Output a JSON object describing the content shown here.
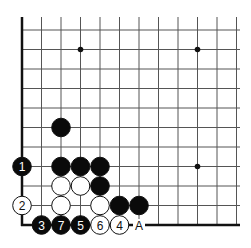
{
  "diagram": {
    "type": "go-board-corner",
    "corner": "bottom-left",
    "grid": {
      "origin_x": 22,
      "origin_y": 225,
      "spacing": 19.5,
      "cols": 12,
      "rows": 11
    },
    "star_points": [
      {
        "col": 3,
        "row": 9
      },
      {
        "col": 9,
        "row": 9
      },
      {
        "col": 9,
        "row": 3
      }
    ],
    "stones": [
      {
        "color": "black",
        "col": 2,
        "row": 5,
        "label": ""
      },
      {
        "color": "black",
        "col": 0,
        "row": 3,
        "label": "1"
      },
      {
        "color": "black",
        "col": 2,
        "row": 3,
        "label": ""
      },
      {
        "color": "black",
        "col": 3,
        "row": 3,
        "label": ""
      },
      {
        "color": "black",
        "col": 4,
        "row": 3,
        "label": ""
      },
      {
        "color": "white",
        "col": 2,
        "row": 2,
        "label": ""
      },
      {
        "color": "white",
        "col": 3,
        "row": 2,
        "label": ""
      },
      {
        "color": "black",
        "col": 4,
        "row": 2,
        "label": ""
      },
      {
        "color": "white",
        "col": 0,
        "row": 1,
        "label": "2"
      },
      {
        "color": "white",
        "col": 2,
        "row": 1,
        "label": ""
      },
      {
        "color": "white",
        "col": 4,
        "row": 1,
        "label": ""
      },
      {
        "color": "black",
        "col": 5,
        "row": 1,
        "label": ""
      },
      {
        "color": "black",
        "col": 6,
        "row": 1,
        "label": ""
      },
      {
        "color": "black",
        "col": 1,
        "row": 0,
        "label": "3"
      },
      {
        "color": "black",
        "col": 2,
        "row": 0,
        "label": "7"
      },
      {
        "color": "black",
        "col": 3,
        "row": 0,
        "label": "5"
      },
      {
        "color": "white",
        "col": 4,
        "row": 0,
        "label": "6"
      },
      {
        "color": "white",
        "col": 5,
        "row": 0,
        "label": "4"
      }
    ],
    "markers": [
      {
        "col": 6,
        "row": 0,
        "label": "A"
      }
    ],
    "colors": {
      "line": "#555555",
      "edge": "#111111",
      "black": "#0a0a0a",
      "white": "#ffffff"
    }
  }
}
